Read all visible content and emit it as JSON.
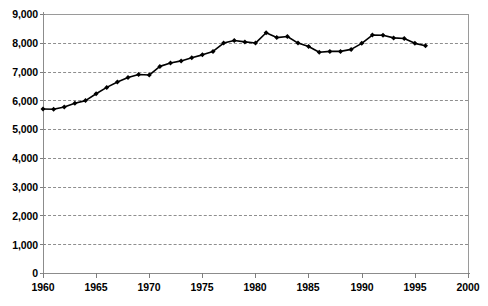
{
  "chart_data": {
    "type": "line",
    "title": "",
    "subtitle": "",
    "xlabel": "",
    "ylabel": "",
    "xlim": [
      1960,
      2000
    ],
    "ylim": [
      0,
      9000
    ],
    "grid": true,
    "legend": null,
    "marker": "diamond",
    "line_color": "#000000",
    "grid_color": "#8e8e8e",
    "axis_color": "#8c8c8c",
    "y_ticks": [
      0,
      1000,
      2000,
      3000,
      4000,
      5000,
      6000,
      7000,
      8000,
      9000
    ],
    "y_tick_labels": [
      "0",
      "1,000",
      "2,000",
      "3,000",
      "4,000",
      "5,000",
      "6,000",
      "7,000",
      "8,000",
      "9,000"
    ],
    "x_ticks": [
      1960,
      1965,
      1970,
      1975,
      1980,
      1985,
      1990,
      1995,
      2000
    ],
    "x_tick_labels": [
      "1960",
      "1965",
      "1970",
      "1975",
      "1980",
      "1985",
      "1990",
      "1995",
      "2000"
    ],
    "x": [
      1960,
      1961,
      1962,
      1963,
      1964,
      1965,
      1966,
      1967,
      1968,
      1969,
      1970,
      1971,
      1972,
      1973,
      1974,
      1975,
      1976,
      1977,
      1978,
      1979,
      1980,
      1981,
      1982,
      1983,
      1984,
      1985,
      1986,
      1987,
      1988,
      1989,
      1990,
      1991,
      1992,
      1993,
      1994,
      1995,
      1996
    ],
    "values": [
      5700,
      5690,
      5770,
      5900,
      5990,
      6230,
      6450,
      6640,
      6790,
      6900,
      6880,
      7180,
      7300,
      7370,
      7480,
      7580,
      7700,
      7990,
      8080,
      8030,
      7990,
      8350,
      8180,
      8220,
      7990,
      7870,
      7670,
      7700,
      7700,
      7770,
      7980,
      8270,
      8260,
      8170,
      8150,
      7980,
      7900
    ],
    "series": [
      {
        "name": "series-1",
        "values": [
          5700,
          5690,
          5770,
          5900,
          5990,
          6230,
          6450,
          6640,
          6790,
          6900,
          6880,
          7180,
          7300,
          7370,
          7480,
          7580,
          7700,
          7990,
          8080,
          8030,
          7990,
          8350,
          8180,
          8220,
          7990,
          7870,
          7670,
          7700,
          7700,
          7770,
          7980,
          8270,
          8260,
          8170,
          8150,
          7980,
          7900
        ]
      }
    ]
  },
  "axes": {
    "y_labels": [
      "9,000",
      "8,000",
      "7,000",
      "6,000",
      "5,000",
      "4,000",
      "3,000",
      "2,000",
      "1,000",
      "0"
    ],
    "x_labels": [
      "1960",
      "1965",
      "1970",
      "1975",
      "1980",
      "1985",
      "1990",
      "1995",
      "2000"
    ]
  }
}
